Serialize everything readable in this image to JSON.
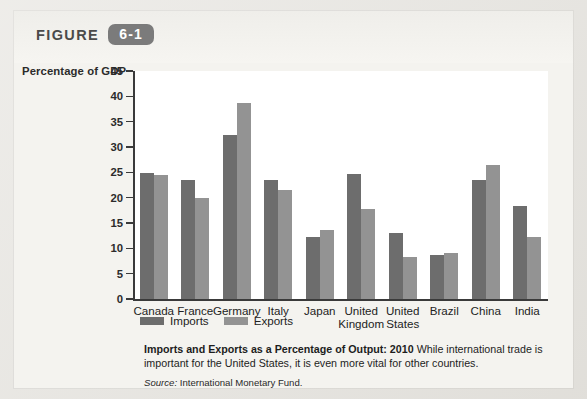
{
  "figure": {
    "label": "FIGURE",
    "number": "6-1"
  },
  "chart_data": {
    "type": "bar",
    "title": "Imports and Exports as a Percentage of Output: 2010",
    "ylabel": "Percentage of GDP",
    "xlabel": "",
    "ylim": [
      0,
      45
    ],
    "yticks": [
      0,
      5,
      10,
      15,
      20,
      25,
      30,
      35,
      40,
      45
    ],
    "grid": false,
    "legend_position": "bottom-left",
    "categories": [
      "Canada",
      "France",
      "Germany",
      "Italy",
      "Japan",
      "United Kingdom",
      "United States",
      "Brazil",
      "China",
      "India"
    ],
    "category_lines": [
      [
        "Canada"
      ],
      [
        "France"
      ],
      [
        "Germany"
      ],
      [
        "Italy"
      ],
      [
        "Japan"
      ],
      [
        "United",
        "Kingdom"
      ],
      [
        "United",
        "States"
      ],
      [
        "Brazil"
      ],
      [
        "China"
      ],
      [
        "India"
      ]
    ],
    "series": [
      {
        "name": "Imports",
        "color": "#6d6d6d",
        "values": [
          24.8,
          23.5,
          32.3,
          23.5,
          12.3,
          24.6,
          13.0,
          8.6,
          23.4,
          18.4
        ]
      },
      {
        "name": "Exports",
        "color": "#939393",
        "values": [
          24.4,
          19.9,
          38.7,
          21.5,
          13.7,
          17.8,
          8.3,
          9.1,
          26.4,
          12.2
        ]
      }
    ]
  },
  "caption": {
    "bold_lead": "Imports and Exports as a Percentage of Output: 2010",
    "body": "While international trade is important for the United States, it is even more vital for other countries.",
    "source_label": "Source:",
    "source_value": "International Monetary Fund."
  }
}
